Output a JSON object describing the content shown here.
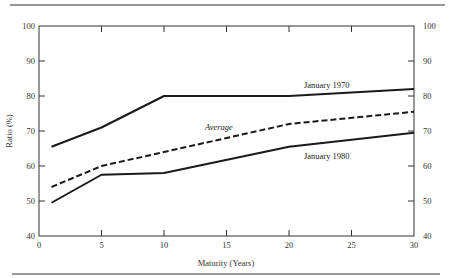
{
  "chart_data": {
    "type": "line",
    "title": "",
    "xlabel": "Maturity (Years)",
    "ylabel": "Ratio (%)",
    "xlim": [
      0,
      30
    ],
    "ylim": [
      40,
      100
    ],
    "x_ticks": [
      0,
      5,
      10,
      15,
      20,
      25,
      30
    ],
    "y_ticks": [
      40,
      50,
      60,
      70,
      80,
      90,
      100
    ],
    "right_y_ticks": [
      40,
      50,
      60,
      70,
      80,
      90,
      100
    ],
    "grid": false,
    "legend": "inline labels",
    "series": [
      {
        "name": "January 1970",
        "style": "solid",
        "x": [
          1,
          5,
          10,
          20,
          30
        ],
        "values": [
          65.5,
          71,
          80,
          80,
          82
        ]
      },
      {
        "name": "Average",
        "style": "dashed",
        "x": [
          1,
          5,
          10,
          20,
          30
        ],
        "values": [
          54,
          60,
          64,
          72,
          75.5
        ]
      },
      {
        "name": "January 1980",
        "style": "solid",
        "x": [
          1,
          5,
          10,
          20,
          30
        ],
        "values": [
          49.5,
          57.5,
          58,
          65.5,
          69.5
        ]
      }
    ]
  },
  "labels": {
    "xlabel": "Maturity (Years)",
    "ylabel": "Ratio (%)",
    "series_1970": "January 1970",
    "series_avg": "Average",
    "series_1980": "January 1980"
  },
  "colors": {
    "line": "#1a1a1a",
    "axis": "#333333",
    "rule": "#333333"
  }
}
